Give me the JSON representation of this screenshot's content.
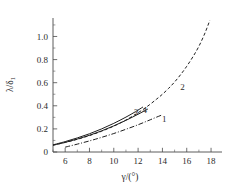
{
  "chart_data": {
    "type": "line",
    "title": "",
    "xlabel": "γ/(°)",
    "ylabel": "λ/δ₁",
    "ylabel_main": "λ/δ",
    "ylabel_sub": "1",
    "xlabel_main": "γ/(°)",
    "xlim": [
      5.0,
      18.9
    ],
    "ylim": [
      0.0,
      1.16
    ],
    "grid": false,
    "legend_position": "inline-curve-labels",
    "x_ticks": [
      6,
      8,
      10,
      12,
      14,
      16,
      18
    ],
    "x_tick_labels": [
      "6",
      "8",
      "10",
      "12",
      "14",
      "16",
      "18"
    ],
    "x_minor_ticks": [
      5,
      7,
      9,
      11,
      13,
      15,
      17
    ],
    "y_ticks": [
      0,
      0.2,
      0.4,
      0.6,
      0.8,
      1.0
    ],
    "y_tick_labels": [
      "0",
      "0.2",
      "0.4",
      "0.6",
      "0.8",
      "1.0"
    ],
    "y_minor_ticks": [
      0.1,
      0.3,
      0.5,
      0.7,
      0.9,
      1.1
    ],
    "series": [
      {
        "name": "1",
        "label": "1",
        "style": "dash-dot",
        "label_x": 14.15,
        "label_y": 0.285,
        "x": [
          6.0,
          6.5,
          7.0,
          7.5,
          8.0,
          8.5,
          9.0,
          9.5,
          10.0,
          10.5,
          11.0,
          11.5,
          12.0,
          12.5,
          13.0,
          13.5,
          14.0
        ],
        "y": [
          0.042,
          0.055,
          0.068,
          0.082,
          0.096,
          0.111,
          0.127,
          0.143,
          0.16,
          0.178,
          0.197,
          0.216,
          0.236,
          0.257,
          0.279,
          0.301,
          0.322
        ]
      },
      {
        "name": "2",
        "label": "2",
        "style": "dashed",
        "label_x": 15.65,
        "label_y": 0.565,
        "x": [
          5.0,
          6.0,
          7.0,
          8.0,
          9.0,
          10.0,
          11.0,
          12.0,
          12.8,
          13.5,
          14.0,
          14.5,
          15.0,
          15.5,
          16.0,
          16.5,
          17.0,
          17.5,
          17.9
        ],
        "y": [
          0.06,
          0.083,
          0.11,
          0.142,
          0.18,
          0.224,
          0.277,
          0.34,
          0.398,
          0.456,
          0.5,
          0.55,
          0.606,
          0.67,
          0.742,
          0.823,
          0.915,
          1.03,
          1.14
        ]
      },
      {
        "name": "3",
        "label": "3",
        "style": "solid",
        "label_x": 11.85,
        "label_y": 0.352,
        "x": [
          5.0,
          6.0,
          7.0,
          8.0,
          9.0,
          10.0,
          11.0,
          11.8,
          12.4
        ],
        "y": [
          0.062,
          0.09,
          0.122,
          0.158,
          0.2,
          0.248,
          0.302,
          0.35,
          0.39
        ]
      },
      {
        "name": "4",
        "label": "4",
        "style": "solid",
        "label_x": 12.55,
        "label_y": 0.362,
        "x": [
          5.0,
          6.0,
          7.0,
          8.0,
          9.0,
          10.0,
          11.0,
          12.0,
          12.8
        ],
        "y": [
          0.058,
          0.083,
          0.112,
          0.145,
          0.183,
          0.226,
          0.274,
          0.327,
          0.372
        ]
      }
    ]
  }
}
